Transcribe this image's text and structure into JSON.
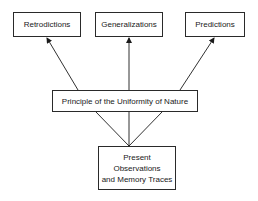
{
  "diagram": {
    "top_nodes": [
      {
        "label": "Retrodictions"
      },
      {
        "label": "Generalizations"
      },
      {
        "label": "Predictions"
      }
    ],
    "middle_node": {
      "label": "Principle of the Uniformity of Nature"
    },
    "bottom_node": {
      "line1": "Present Observations",
      "line2": "and Memory Traces"
    },
    "edges": [
      {
        "from": "Present Observations and Memory Traces",
        "to": "Principle of the Uniformity of Nature",
        "style": "line"
      },
      {
        "from": "Principle of the Uniformity of Nature",
        "to": "Retrodictions",
        "style": "arrow"
      },
      {
        "from": "Principle of the Uniformity of Nature",
        "to": "Generalizations",
        "style": "arrow"
      },
      {
        "from": "Principle of the Uniformity of Nature",
        "to": "Predictions",
        "style": "arrow"
      }
    ]
  }
}
